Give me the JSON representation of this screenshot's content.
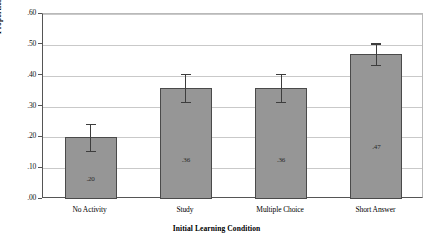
{
  "chart_data": {
    "type": "bar",
    "title": "",
    "xlabel": "Initial Learning Condition",
    "ylabel": "Proportion Correct",
    "categories": [
      "No Activity",
      "Study",
      "Multiple Choice",
      "Short Answer"
    ],
    "values": [
      0.2,
      0.36,
      0.36,
      0.47
    ],
    "value_labels": [
      ".20",
      ".36",
      ".36",
      ".47"
    ],
    "errors": [
      0.045,
      0.045,
      0.045,
      0.035
    ],
    "ylim": [
      0.0,
      0.6
    ],
    "ytick_labels": [
      ".60",
      ".50",
      ".40",
      ".30",
      ".20",
      ".10",
      ".00"
    ],
    "ytick_values": [
      0.6,
      0.5,
      0.4,
      0.3,
      0.2,
      0.1,
      0.0
    ],
    "grid": true,
    "legend": "none",
    "bar_color": "#969696",
    "bar_border_color": "#4a4a4a",
    "grid_color": "#c9c9c9",
    "axis_color": "#555555"
  }
}
